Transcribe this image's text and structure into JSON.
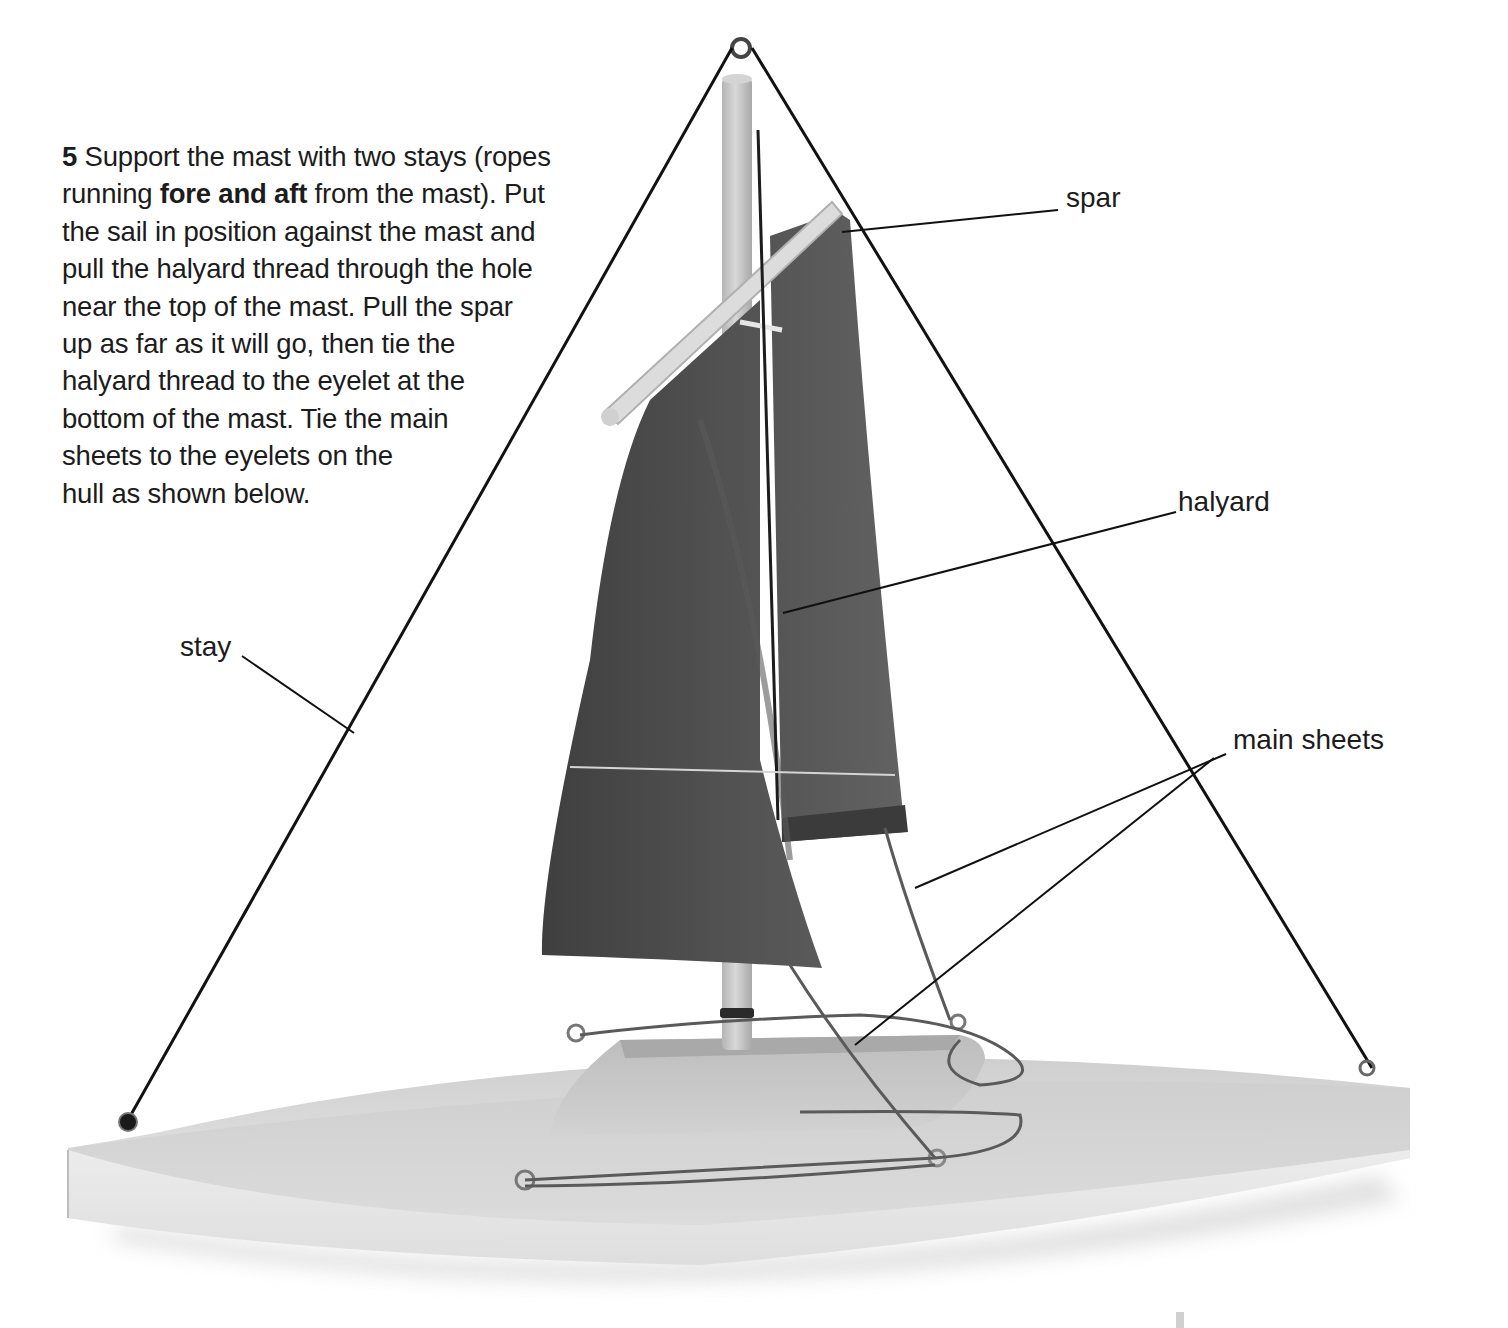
{
  "step": {
    "number": "5",
    "lines": [
      {
        "parts": [
          {
            "text": "5",
            "bold": true
          },
          {
            "text": " Support the mast with two stays (ropes",
            "bold": false
          }
        ]
      },
      {
        "parts": [
          {
            "text": "running ",
            "bold": false
          },
          {
            "text": "fore and aft",
            "bold": true
          },
          {
            "text": " from the mast). Put",
            "bold": false
          }
        ]
      },
      {
        "parts": [
          {
            "text": "the sail in position against the mast and",
            "bold": false
          }
        ]
      },
      {
        "parts": [
          {
            "text": "pull the halyard thread through the hole",
            "bold": false
          }
        ]
      },
      {
        "parts": [
          {
            "text": "near the top of the mast. Pull the spar",
            "bold": false
          }
        ]
      },
      {
        "parts": [
          {
            "text": "up as far as it will go, then tie the",
            "bold": false
          }
        ]
      },
      {
        "parts": [
          {
            "text": "halyard thread to the eyelet at the",
            "bold": false
          }
        ]
      },
      {
        "parts": [
          {
            "text": "bottom of the mast. Tie the main",
            "bold": false
          }
        ]
      },
      {
        "parts": [
          {
            "text": "sheets to the eyelets on the",
            "bold": false
          }
        ]
      },
      {
        "parts": [
          {
            "text": "hull as shown below.",
            "bold": false
          }
        ]
      }
    ]
  },
  "labels": {
    "spar": "spar",
    "halyard": "halyard",
    "main_sheets": "main sheets",
    "stay": "stay"
  },
  "colors": {
    "text": "#1c1c1c",
    "sail": "#4a4a4a",
    "sail_light": "#5c5c5c",
    "mast": "#c9c9c9",
    "hull_top": "#d6d6d6",
    "hull_side": "#e6e6e6",
    "rope": "#111111",
    "sheet_rope": "#5a5a5a"
  }
}
